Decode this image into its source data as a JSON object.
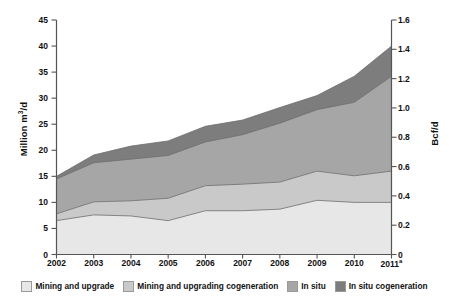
{
  "chart_data": {
    "type": "area",
    "stacked": true,
    "title": "",
    "xlabel": "",
    "ylabel": "Million m³/d",
    "y2label": "Bcf/d",
    "categories": [
      "2002",
      "2003",
      "2004",
      "2005",
      "2006",
      "2007",
      "2008",
      "2009",
      "2010",
      "2011"
    ],
    "category_labels": [
      "2002",
      "2003",
      "2004",
      "2005",
      "2006",
      "2007",
      "2008",
      "2009",
      "2010",
      "2011ᵃ"
    ],
    "ylim": [
      0,
      45
    ],
    "yticks": [
      0,
      5,
      10,
      15,
      20,
      25,
      30,
      35,
      40,
      45
    ],
    "ytick_labels": [
      "0",
      "5",
      "10",
      "15",
      "20",
      "25",
      "30",
      "35",
      "40",
      "45"
    ],
    "y2lim": [
      0,
      1.6
    ],
    "y2ticks": [
      0,
      0.2,
      0.4,
      0.6,
      0.8,
      1.0,
      1.2,
      1.4,
      1.6
    ],
    "y2tick_labels": [
      "0",
      "0.2",
      "0.4",
      "0.6",
      "0.8",
      "1.0",
      "1.2",
      "1.4",
      "1.6"
    ],
    "grid": false,
    "legend_position": "bottom",
    "series": [
      {
        "name": "Mining and upgrade",
        "color": "#e7e7e7",
        "values": [
          6.5,
          7.6,
          7.4,
          6.5,
          8.4,
          8.4,
          8.7,
          10.4,
          10.0,
          10.0
        ]
      },
      {
        "name": "Mining and upgrading cogeneration",
        "color": "#c9c9c9",
        "values": [
          1.3,
          2.5,
          2.9,
          4.3,
          4.8,
          5.1,
          5.2,
          5.6,
          5.1,
          6.0
        ]
      },
      {
        "name": "In situ",
        "color": "#a6a6a6",
        "values": [
          6.7,
          7.5,
          8.0,
          8.2,
          8.4,
          9.5,
          11.3,
          11.8,
          14.1,
          18.2
        ]
      },
      {
        "name": "In situ cogeneration",
        "color": "#7d7d7d",
        "values": [
          0.5,
          1.5,
          2.5,
          2.8,
          3.0,
          2.8,
          3.0,
          2.7,
          5.0,
          5.8
        ]
      }
    ],
    "cumulative": [
      [
        6.5,
        7.6,
        7.4,
        6.5,
        8.4,
        8.4,
        8.7,
        10.4,
        10.0,
        10.0
      ],
      [
        7.8,
        10.1,
        10.3,
        10.8,
        13.2,
        13.5,
        13.9,
        16.0,
        15.1,
        16.0
      ],
      [
        14.5,
        17.6,
        18.3,
        19.0,
        21.6,
        23.0,
        25.2,
        27.8,
        29.2,
        34.2
      ],
      [
        15.0,
        19.1,
        20.8,
        21.8,
        24.6,
        25.8,
        28.2,
        30.5,
        34.2,
        40.0
      ]
    ],
    "footnote_marker": "a"
  },
  "legend": {
    "items": [
      {
        "label": "Mining and upgrade",
        "color": "#e7e7e7"
      },
      {
        "label": "Mining and upgrading cogeneration",
        "color": "#c9c9c9"
      },
      {
        "label": "In situ",
        "color": "#a6a6a6"
      },
      {
        "label": "In situ cogeneration",
        "color": "#7d7d7d"
      }
    ]
  },
  "axes": {
    "left_title_main": "Million m",
    "left_title_sup": "3",
    "left_title_tail": "/d",
    "right_title": "Bcf/d",
    "axis_color": "#555555",
    "text_color": "#111111"
  }
}
